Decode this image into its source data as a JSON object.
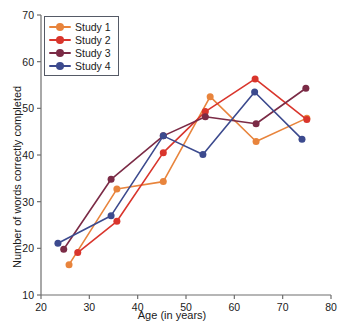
{
  "chart_data": {
    "type": "line",
    "title": "",
    "xlabel": "Age (in years)",
    "ylabel": "Number of words correctly completed",
    "xlim": [
      20,
      80
    ],
    "ylim": [
      10,
      70
    ],
    "xticks": [
      20,
      30,
      40,
      50,
      60,
      70,
      80
    ],
    "yticks": [
      10,
      20,
      30,
      40,
      50,
      60,
      70
    ],
    "grid": false,
    "legend_position": "upper left",
    "series": [
      {
        "name": "Study 1",
        "color": "#E8843C",
        "points": [
          [
            25.8,
            16.5
          ],
          [
            35.7,
            32.7
          ],
          [
            45.3,
            34.3
          ],
          [
            55.0,
            52.5
          ],
          [
            64.5,
            42.9
          ],
          [
            75.0,
            47.9
          ]
        ]
      },
      {
        "name": "Study 2",
        "color": "#D9352C",
        "points": [
          [
            27.6,
            19.1
          ],
          [
            35.7,
            25.8
          ],
          [
            45.3,
            40.5
          ],
          [
            54.0,
            49.3
          ],
          [
            64.3,
            56.3
          ],
          [
            75.0,
            47.6
          ]
        ]
      },
      {
        "name": "Study 3",
        "color": "#7B2B46",
        "points": [
          [
            24.7,
            19.8
          ],
          [
            34.5,
            34.8
          ],
          [
            45.3,
            44.1
          ],
          [
            54.0,
            48.2
          ],
          [
            64.5,
            46.7
          ],
          [
            74.8,
            54.3
          ]
        ]
      },
      {
        "name": "Study 4",
        "color": "#3C4A8E",
        "points": [
          [
            23.5,
            21.1
          ],
          [
            34.5,
            27.0
          ],
          [
            45.3,
            44.1
          ],
          [
            53.5,
            40.1
          ],
          [
            64.2,
            53.5
          ],
          [
            74.0,
            43.4
          ]
        ]
      }
    ]
  },
  "axis": {
    "x_title": "Age (in years)",
    "y_title": "Number of words correctly completed",
    "x_tick_labels": [
      "20",
      "30",
      "40",
      "50",
      "60",
      "70",
      "80"
    ],
    "y_tick_labels": [
      "10",
      "20",
      "30",
      "40",
      "50",
      "60",
      "70"
    ],
    "axis_color": "#6e6e6e"
  },
  "legend": {
    "entries": [
      {
        "label": "Study 1",
        "color": "#E8843C"
      },
      {
        "label": "Study 2",
        "color": "#D9352C"
      },
      {
        "label": "Study 3",
        "color": "#7B2B46"
      },
      {
        "label": "Study 4",
        "color": "#3C4A8E"
      }
    ]
  }
}
